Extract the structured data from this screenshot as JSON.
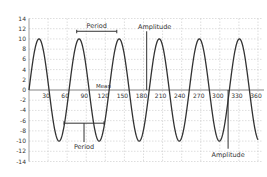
{
  "chart_data": {
    "type": "line",
    "title": "",
    "xlabel": "",
    "ylabel": "",
    "xlim": [
      0,
      360
    ],
    "ylim": [
      -14,
      14
    ],
    "x_ticks": [
      30,
      60,
      90,
      120,
      150,
      180,
      210,
      240,
      270,
      300,
      330,
      360
    ],
    "y_ticks": [
      14,
      12,
      10,
      8,
      6,
      4,
      2,
      0,
      -2,
      -4,
      -6,
      -8,
      -10,
      -12,
      -14
    ],
    "grid": true,
    "legend": null,
    "series": [
      {
        "name": "sine wave",
        "function": "10*sin(2*pi*x/63)",
        "amplitude": 10,
        "period_deg": 63,
        "mean": 0,
        "color": "#333333"
      }
    ],
    "annotations": [
      {
        "label": "Period",
        "type": "bracket-top",
        "x_from": 75,
        "x_to": 138,
        "y": 11.5
      },
      {
        "label": "Amplitude",
        "type": "vertical-line-top",
        "x": 185,
        "y_from": 0,
        "y_to": 10
      },
      {
        "label": "Mean",
        "type": "text",
        "x": 117,
        "y": 1.2
      },
      {
        "label": "Period",
        "type": "bracket-bottom",
        "x_from": 55,
        "x_to": 118,
        "y": -6.5
      },
      {
        "label": "Amplitude",
        "type": "vertical-line-bottom",
        "x": 313,
        "y_from": 0,
        "y_to": -10
      }
    ]
  },
  "labels": {
    "period_top": "Period",
    "amplitude_top": "Amplitude",
    "mean": "Mean",
    "period_bottom": "Period",
    "amplitude_bottom": "Amplitude"
  }
}
